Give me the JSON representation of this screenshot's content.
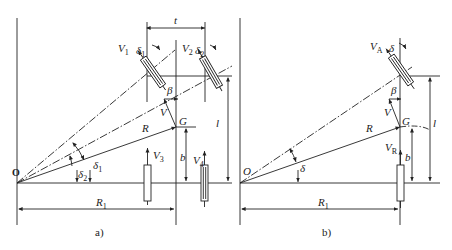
{
  "figure": {
    "panel_a": {
      "caption": "a)",
      "labels": {
        "origin": "O",
        "center_of_gravity": "G",
        "radius": "R",
        "radius_rear": "R",
        "radius_rear_sub": "1",
        "velocity": "V",
        "slip_angle": "β",
        "track": "t",
        "wheelbase": "l",
        "cg_distance": "b",
        "v1": "V",
        "v1_sub": "1",
        "v2": "V",
        "v2_sub": "2",
        "v3": "V",
        "v3_sub": "3",
        "v4": "V",
        "v4_sub": "4",
        "delta1": "δ",
        "delta1_sub": "1",
        "delta2": "δ",
        "delta2_sub": "2",
        "delta1_top": "δ",
        "delta1_top_sub": "1",
        "delta2_top": "δ",
        "delta2_top_sub": "2"
      }
    },
    "panel_b": {
      "caption": "b)",
      "labels": {
        "origin": "O",
        "center_of_gravity": "G",
        "radius": "R",
        "radius_rear": "R",
        "radius_rear_sub": "1",
        "velocity": "V",
        "slip_angle": "β",
        "wheelbase": "l",
        "cg_distance": "b",
        "va": "V",
        "va_sub": "A",
        "vr": "V",
        "vr_sub": "R",
        "delta": "δ",
        "delta_top": "δ"
      }
    },
    "colors": {
      "ink": "#222222",
      "background": "#ffffff"
    }
  }
}
